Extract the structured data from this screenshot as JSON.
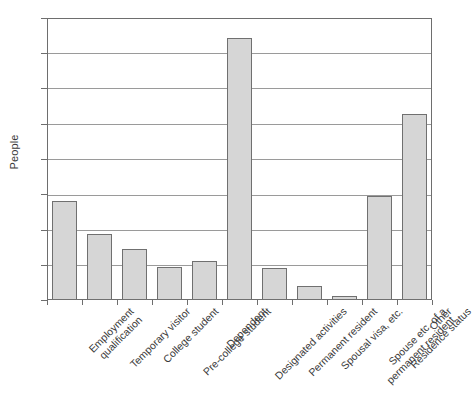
{
  "chart_data": {
    "type": "bar",
    "title": "",
    "xlabel": "",
    "ylabel": "People",
    "ylim": [
      0,
      400
    ],
    "yticks": [
      0,
      50,
      100,
      150,
      200,
      250,
      300,
      350,
      400
    ],
    "grid": true,
    "legend": "none",
    "bar_color": "#d6d6d6",
    "bar_edge_color": "#707070",
    "axis_color": "#6e6e6e",
    "gridline_color": "#9a9a9a",
    "background": "#ffffff",
    "label_rotation_deg": -45,
    "categories": [
      "Employment qualification",
      "Temporary visitor",
      "College student",
      "Pre-college student",
      "Dependent",
      "Designated activities",
      "Permanent resident",
      "Spousal visa, etc.",
      "Spouse etc. of a permanent resident",
      "Residence status",
      "Other"
    ],
    "category_lines": [
      [
        "Employment",
        "qualification"
      ],
      [
        "Temporary visitor",
        ""
      ],
      [
        "College student",
        ""
      ],
      [
        "Pre-college student",
        ""
      ],
      [
        "Dependent",
        ""
      ],
      [
        "Designated activities",
        ""
      ],
      [
        "Permanent resident",
        ""
      ],
      [
        "Spousal visa, etc.",
        ""
      ],
      [
        "Spouse etc. of a",
        "permanent resident"
      ],
      [
        "Residence status",
        ""
      ],
      [
        "Other",
        ""
      ]
    ],
    "values": [
      140,
      94,
      73,
      47,
      55,
      372,
      46,
      20,
      6,
      147,
      264
    ]
  },
  "ytick_labels": [
    "400",
    "350",
    "300",
    "250",
    "200",
    "150",
    "100",
    "50",
    "0"
  ]
}
